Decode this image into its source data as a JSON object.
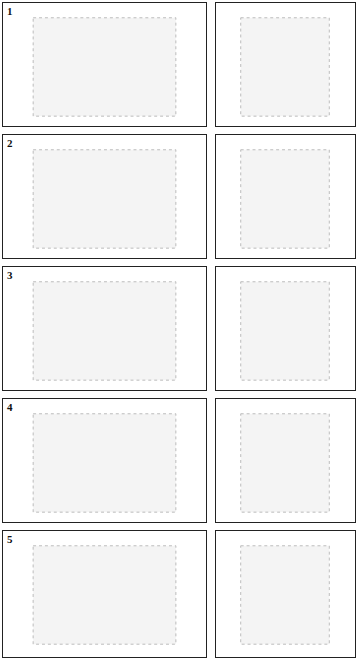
{
  "diagram": {
    "type": "staged-illustration-grid",
    "layout": {
      "rows": 5,
      "columns": 2,
      "column_views": [
        "front view",
        "side view"
      ]
    },
    "stages": [
      {
        "label": "1"
      },
      {
        "label": "2"
      },
      {
        "label": "3"
      },
      {
        "label": "4"
      },
      {
        "label": "5"
      }
    ]
  }
}
